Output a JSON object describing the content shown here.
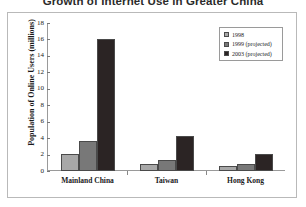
{
  "chart_data": {
    "type": "bar",
    "title": "Growth of Internet Use in Greater China",
    "xlabel": "",
    "ylabel": "Population of Online Users (millions)",
    "categories": [
      "Mainland China",
      "Taiwan",
      "Hong Kong"
    ],
    "series": [
      {
        "name": "1998",
        "values": [
          2.1,
          0.9,
          0.6
        ],
        "color": "#a8a8a8"
      },
      {
        "name": "1999 (projected)",
        "values": [
          3.7,
          1.3,
          0.9
        ],
        "color": "#787878"
      },
      {
        "name": "2003 (projected)",
        "values": [
          16.0,
          4.3,
          2.1
        ],
        "color": "#2b2424"
      }
    ],
    "ylim": [
      0,
      18
    ],
    "yticks": [
      "0",
      "2",
      "4",
      "6",
      "8",
      "10",
      "12",
      "14",
      "16",
      "18"
    ],
    "grid": false,
    "legend_position": "top-right"
  },
  "legend": {
    "entries": [
      {
        "label": "1998"
      },
      {
        "label": "1999 (projected)"
      },
      {
        "label": "2003 (projected)"
      }
    ]
  },
  "axes": {
    "y_title": "Population of Online Users (millions)"
  }
}
